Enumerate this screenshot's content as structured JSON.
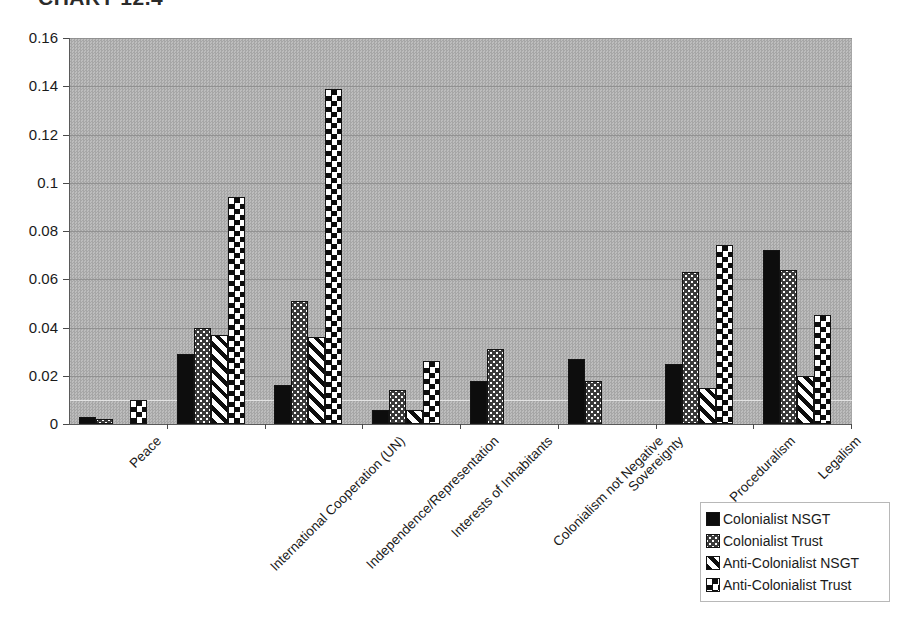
{
  "chart_data": {
    "type": "bar",
    "title": "CHART 12.4",
    "xlabel": "",
    "ylabel": "",
    "ylim": [
      0,
      0.16
    ],
    "ytick_labels": [
      "0.16",
      "0.14",
      "0.12",
      "0.1",
      "0.08",
      "0.06",
      "0.04",
      "0.02",
      "0"
    ],
    "ytick_values": [
      0.16,
      0.14,
      0.12,
      0.1,
      0.08,
      0.06,
      0.04,
      0.02,
      0
    ],
    "grid": true,
    "legend_position": "bottom-right",
    "categories": [
      "Peace",
      "International Cooperation (UN)",
      "Independence/Representation",
      "Interests of Inhabitants",
      "Colonialism not Negative",
      "Sovereignty",
      "Proceduralism",
      "Legalism"
    ],
    "series": [
      {
        "name": "Colonialist NSGT",
        "fill": "solid-black",
        "values": [
          0.003,
          0.029,
          0.016,
          0.006,
          0.018,
          0.027,
          0.025,
          0.072
        ]
      },
      {
        "name": "Colonialist Trust",
        "fill": "dark-dotted",
        "values": [
          0.002,
          0.04,
          0.051,
          0.014,
          0.031,
          0.018,
          0.063,
          0.064
        ]
      },
      {
        "name": "Anti-Colonialist NSGT",
        "fill": "diagonal-stripes",
        "values": [
          0.0,
          0.037,
          0.036,
          0.006,
          0.0,
          0.0,
          0.015,
          0.02
        ]
      },
      {
        "name": "Anti-Colonialist Trust",
        "fill": "checkerboard",
        "values": [
          0.01,
          0.094,
          0.139,
          0.026,
          0.0,
          0.0,
          0.074,
          0.045
        ]
      }
    ]
  },
  "legend": {
    "items": [
      {
        "label": "Colonialist NSGT"
      },
      {
        "label": "Colonialist Trust"
      },
      {
        "label": "Anti-Colonialist NSGT"
      },
      {
        "label": "Anti-Colonialist Trust"
      }
    ]
  }
}
